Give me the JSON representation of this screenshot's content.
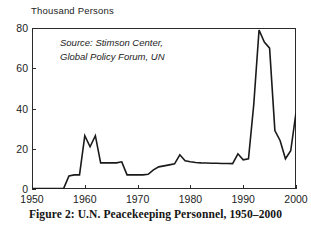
{
  "figure": {
    "caption": "Figure 2: U.N. Peacekeeping Personnel, 1950–2000",
    "axis_unit_label": "Thousand Persons",
    "source_line_1": "Source: Stimson Center,",
    "source_line_2": "Global Policy Forum, UN",
    "line_color": "#1a1a1a",
    "frame_color": "#2b2b2b",
    "background_color": "#ffffff"
  },
  "chart_data": {
    "type": "line",
    "title": "Figure 2: U.N. Peacekeeping Personnel, 1950–2000",
    "subtitle": "",
    "xlabel": "",
    "ylabel": "Thousand Persons",
    "xlim": [
      1950,
      2000
    ],
    "ylim": [
      0,
      80
    ],
    "xticks": [
      1950,
      1960,
      1970,
      1980,
      1990,
      2000
    ],
    "yticks": [
      0,
      20,
      40,
      60,
      80
    ],
    "grid": false,
    "legend": null,
    "annotations": [
      {
        "text": "Source: Stimson Center, Global Policy Forum, UN",
        "x": 1952,
        "y": 74
      }
    ],
    "units": "thousand persons",
    "series": [
      {
        "name": "U.N. Peacekeeping Personnel",
        "x": [
          1950,
          1951,
          1952,
          1953,
          1954,
          1955,
          1956,
          1957,
          1958,
          1959,
          1960,
          1961,
          1962,
          1963,
          1964,
          1965,
          1966,
          1967,
          1968,
          1969,
          1970,
          1971,
          1972,
          1973,
          1974,
          1975,
          1976,
          1977,
          1978,
          1979,
          1980,
          1981,
          1982,
          1983,
          1984,
          1985,
          1986,
          1987,
          1988,
          1989,
          1990,
          1991,
          1992,
          1993,
          1994,
          1995,
          1996,
          1997,
          1998,
          1999,
          2000
        ],
        "values": [
          0.2,
          0.2,
          0.2,
          0.2,
          0.2,
          0.2,
          0.3,
          6.5,
          7.0,
          7.0,
          26.5,
          21.0,
          26.5,
          13.0,
          13.0,
          13.0,
          13.0,
          13.5,
          7.0,
          7.0,
          7.0,
          7.0,
          7.3,
          9.5,
          11.0,
          11.5,
          12.0,
          12.5,
          17.0,
          14.0,
          13.5,
          13.2,
          13.0,
          12.9,
          12.8,
          12.8,
          12.7,
          12.7,
          12.6,
          17.5,
          14.5,
          15.0,
          42.0,
          79.0,
          73.0,
          70.0,
          29.0,
          24.0,
          15.0,
          19.0,
          38.0
        ]
      }
    ]
  },
  "yticks": [
    {
      "label": "80",
      "value": 80
    },
    {
      "label": "60",
      "value": 60
    },
    {
      "label": "40",
      "value": 40
    },
    {
      "label": "20",
      "value": 20
    },
    {
      "label": "0",
      "value": 0
    }
  ],
  "xticks": [
    {
      "label": "1950",
      "value": 1950
    },
    {
      "label": "1960",
      "value": 1960
    },
    {
      "label": "1970",
      "value": 1970
    },
    {
      "label": "1980",
      "value": 1980
    },
    {
      "label": "1990",
      "value": 1990
    },
    {
      "label": "2000",
      "value": 2000
    }
  ]
}
